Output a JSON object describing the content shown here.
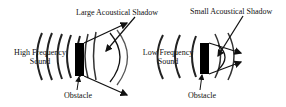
{
  "left_panel": {
    "shadow_label": "Large Acoustical Shadow",
    "source_label_line1": "High Frequency",
    "source_label_line2": "Sound",
    "obstacle_label": "Obstacle"
  },
  "right_panel": {
    "shadow_label": "Small Acoustical Shadow",
    "source_label_line1": "Low Frequency",
    "source_label_line2": "Sound",
    "obstacle_label": "Obstacle"
  },
  "colors": {
    "ink": "#111111",
    "wave_gray": "#9a9a9a"
  }
}
